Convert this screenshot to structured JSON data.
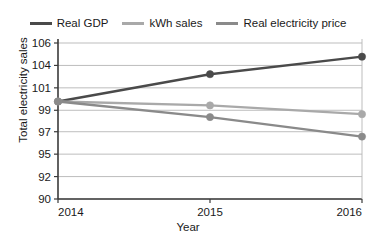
{
  "chart_data": {
    "type": "line",
    "title": "",
    "xlabel": "Year",
    "ylabel": "Total electricity sales",
    "x": [
      2014,
      2015,
      2016
    ],
    "xtick_labels": [
      "2014",
      "2015",
      "2016"
    ],
    "ytick_labels": [
      "90",
      "92",
      "95",
      "97",
      "99",
      "101",
      "104",
      "106"
    ],
    "ytick_values": [
      90,
      92.3,
      94.6,
      96.9,
      99.1,
      101.4,
      103.7,
      106
    ],
    "ylim": [
      90,
      106
    ],
    "xlim": [
      2014,
      2016
    ],
    "grid": "horizontal",
    "legend_position": "top",
    "markers": "circle",
    "series": [
      {
        "name": "Real GDP",
        "color": "#4a4a4a",
        "values": [
          100.0,
          102.8,
          104.6
        ]
      },
      {
        "name": "kWh sales",
        "color": "#a9a9a9",
        "values": [
          100.0,
          99.6,
          98.7
        ]
      },
      {
        "name": "Real electricity price",
        "color": "#8a8a8a",
        "values": [
          100.0,
          98.4,
          96.4
        ]
      }
    ]
  },
  "legend": {
    "items": [
      {
        "label": "Real GDP",
        "color": "#4a4a4a"
      },
      {
        "label": "kWh sales",
        "color": "#a9a9a9"
      },
      {
        "label": "Real electricity price",
        "color": "#8a8a8a"
      }
    ]
  },
  "axes": {
    "x_title": "Year",
    "y_title": "Total electricity sales",
    "x_ticks": [
      "2014",
      "2015",
      "2016"
    ],
    "y_ticks": [
      "106",
      "104",
      "101",
      "99",
      "97",
      "95",
      "92",
      "90"
    ]
  },
  "colors": {
    "axis": "#3a3a3a",
    "grid": "#b5b5b5",
    "text": "#1a1a1a",
    "background": "#ffffff"
  }
}
